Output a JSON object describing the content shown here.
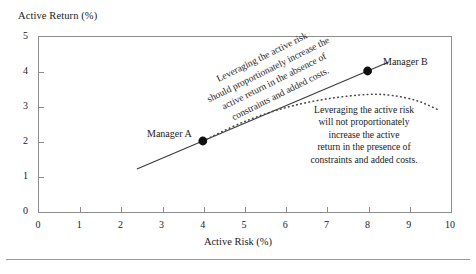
{
  "chart_data": {
    "type": "line",
    "title": "",
    "xlabel": "Active Risk (%)",
    "ylabel": "Active Return (%)",
    "xlim": [
      0,
      10
    ],
    "ylim": [
      0,
      5
    ],
    "xticks": [
      "0",
      "1",
      "2",
      "3",
      "4",
      "5",
      "6",
      "7",
      "8",
      "9",
      "10"
    ],
    "yticks": [
      "0",
      "1",
      "2",
      "3",
      "4",
      "5"
    ],
    "grid": false,
    "legend_position": "none",
    "series": [
      {
        "name": "unconstrained-linear",
        "style": "solid",
        "color": "#3a3a3a",
        "x": [
          2.4,
          8.5
        ],
        "values": [
          1.2,
          4.25
        ]
      },
      {
        "name": "constrained-concave",
        "style": "dotted",
        "color": "#4a4a4a",
        "x": [
          4.0,
          5.0,
          6.0,
          7.0,
          8.0,
          8.6,
          9.2,
          9.7
        ],
        "values": [
          2.0,
          2.55,
          2.95,
          3.2,
          3.33,
          3.3,
          3.15,
          2.9
        ]
      }
    ],
    "points": [
      {
        "label": "Manager A",
        "x": 4,
        "y": 2
      },
      {
        "label": "Manager B",
        "x": 8,
        "y": 4
      }
    ],
    "annotations": [
      {
        "name": "linear-annotation",
        "rotated": true,
        "lines": [
          "Leveraging the active risk",
          "should proportionately increase the",
          "active return in the absence of",
          "constraints and added costs."
        ]
      },
      {
        "name": "concave-annotation",
        "rotated": false,
        "lines": [
          "Leveraging the active risk",
          "will not proportionately",
          "increase the active",
          "return in the presence of",
          "constraints and added costs."
        ]
      }
    ],
    "colors": {
      "axis": "#8d8d8d",
      "text": "#1a1a1a",
      "marker": "#101010",
      "rule": "#9a9a9a"
    }
  },
  "axis": {
    "y_title": "Active Return (%)",
    "x_title": "Active Risk (%)"
  },
  "annot_line": {
    "l0": "Leveraging the active risk",
    "l1": "should proportionately increase the",
    "l2": "active return in the absence of",
    "l3": "constraints and added costs."
  },
  "annot_curve": {
    "l0": "Leveraging the active risk",
    "l1": "will not proportionately",
    "l2": "increase the active",
    "l3": "return in the presence of",
    "l4": "constraints and added costs."
  },
  "labels": {
    "manager_a": "Manager A",
    "manager_b": "Manager B"
  }
}
